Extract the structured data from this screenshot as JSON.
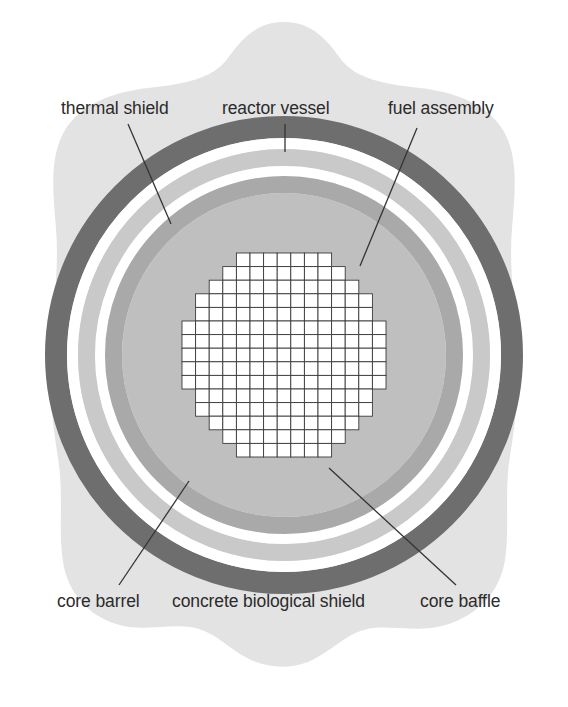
{
  "diagram": {
    "type": "labelled-cross-section",
    "center": {
      "x": 284,
      "y": 355
    },
    "background_color": "#e3e3e3",
    "labels": {
      "thermal_shield": "thermal shield",
      "reactor_vessel": "reactor vessel",
      "fuel_assembly": "fuel assembly",
      "core_barrel": "core barrel",
      "concrete_biological_shield": "concrete biological shield",
      "core_baffle": "core baffle"
    },
    "layers": [
      {
        "name": "concrete biological shield",
        "color": "#e3e3e3",
        "outer_r": 300,
        "inner_r": 240
      },
      {
        "name": "reactor vessel",
        "color": "#6e6e6e",
        "outer_r": 239,
        "inner_r": 217
      },
      {
        "name": "annulus gap outer",
        "color": "#ffffff",
        "outer_r": 217,
        "inner_r": 206
      },
      {
        "name": "thermal shield",
        "color": "#c9c9c9",
        "outer_r": 206,
        "inner_r": 189
      },
      {
        "name": "annulus gap inner",
        "color": "#ffffff",
        "outer_r": 189,
        "inner_r": 179
      },
      {
        "name": "core barrel",
        "color": "#a9a9a9",
        "outer_r": 179,
        "inner_r": 162
      },
      {
        "name": "core baffle",
        "color": "#bfbfbf",
        "outer_r": 162,
        "inner_r": 0
      }
    ],
    "core_grid": {
      "columns": 15,
      "rows": 15,
      "cell_size": 13.6,
      "cell_fill": "#ffffff",
      "cell_stroke": "#3a3a3a",
      "row_spans": [
        [
          4,
          11
        ],
        [
          3,
          12
        ],
        [
          2,
          13
        ],
        [
          1,
          14
        ],
        [
          1,
          14
        ],
        [
          0,
          15
        ],
        [
          0,
          15
        ],
        [
          0,
          15
        ],
        [
          0,
          15
        ],
        [
          0,
          15
        ],
        [
          1,
          14
        ],
        [
          1,
          14
        ],
        [
          2,
          13
        ],
        [
          3,
          12
        ],
        [
          4,
          11
        ]
      ]
    },
    "leaders": [
      {
        "name": "thermal-shield-leader",
        "x1": 128,
        "y1": 124,
        "x2": 171,
        "y2": 224
      },
      {
        "name": "reactor-vessel-leader",
        "x1": 285,
        "y1": 124,
        "x2": 285,
        "y2": 152
      },
      {
        "name": "fuel-assembly-leader",
        "x1": 417,
        "y1": 128,
        "x2": 360,
        "y2": 266
      },
      {
        "name": "core-barrel-leader",
        "x1": 189,
        "y1": 481,
        "x2": 119,
        "y2": 585
      },
      {
        "name": "core-baffle-leader",
        "x1": 329,
        "y1": 468,
        "x2": 456,
        "y2": 585
      }
    ]
  }
}
